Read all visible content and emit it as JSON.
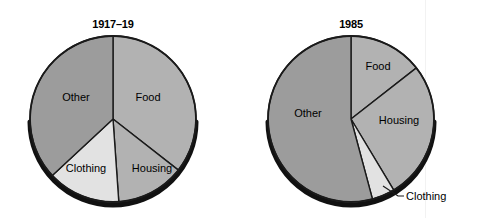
{
  "figure": {
    "background_color": "#ffffff",
    "width": 477,
    "height": 218
  },
  "palette": {
    "food": "#b2b2b2",
    "housing": "#b2b2b2",
    "clothing": "#e2e2e2",
    "other": "#9c9c9c",
    "outline": "#1a1a1a",
    "shadow": "#111111",
    "text": "#000000"
  },
  "charts": [
    {
      "id": "pie-1917-19",
      "title": "1917–19",
      "center": {
        "x": 113,
        "y": 119
      },
      "radius": 83,
      "labels_inside": [
        {
          "name": "Other",
          "x": 76,
          "y": 97
        },
        {
          "name": "Food",
          "x": 148,
          "y": 97
        },
        {
          "name": "Clothing",
          "x": 86,
          "y": 168
        },
        {
          "name": "Housing",
          "x": 152,
          "y": 168
        }
      ]
    },
    {
      "id": "pie-1985",
      "title": "1985",
      "center": {
        "x": 351,
        "y": 119
      },
      "radius": 83,
      "labels_inside": [
        {
          "name": "Other",
          "x": 308,
          "y": 113
        },
        {
          "name": "Food",
          "x": 378,
          "y": 66
        },
        {
          "name": "Housing",
          "x": 399,
          "y": 120
        }
      ],
      "labels_outside": [
        {
          "name": "Clothing",
          "x": 405,
          "y": 195
        }
      ]
    }
  ],
  "chart_data": [
    {
      "type": "pie",
      "title": "1917–19",
      "categories": [
        "Food",
        "Housing",
        "Clothing",
        "Other"
      ],
      "values": [
        35.5,
        13.3,
        14.2,
        37.0
      ],
      "units": "percent",
      "angles_deg": [
        128,
        48,
        51,
        133
      ],
      "start_angle_deg": 0,
      "direction": "clockwise",
      "colors": [
        "#b2b2b2",
        "#b2b2b2",
        "#e2e2e2",
        "#9c9c9c"
      ],
      "labels": [
        "Food",
        "Housing",
        "Clothing",
        "Other"
      ],
      "legend": "none",
      "xlabel": "",
      "ylabel": ""
    },
    {
      "type": "pie",
      "title": "1985",
      "categories": [
        "Food",
        "Housing",
        "Clothing",
        "Other"
      ],
      "values": [
        14.4,
        26.9,
        4.5,
        54.2
      ],
      "units": "percent",
      "angles_deg": [
        52,
        97,
        16,
        195
      ],
      "start_angle_deg": 0,
      "direction": "clockwise",
      "colors": [
        "#b2b2b2",
        "#b2b2b2",
        "#e2e2e2",
        "#9c9c9c"
      ],
      "labels": [
        "Food",
        "Housing",
        "Clothing",
        "Other"
      ],
      "legend": "none",
      "xlabel": "",
      "ylabel": ""
    }
  ]
}
